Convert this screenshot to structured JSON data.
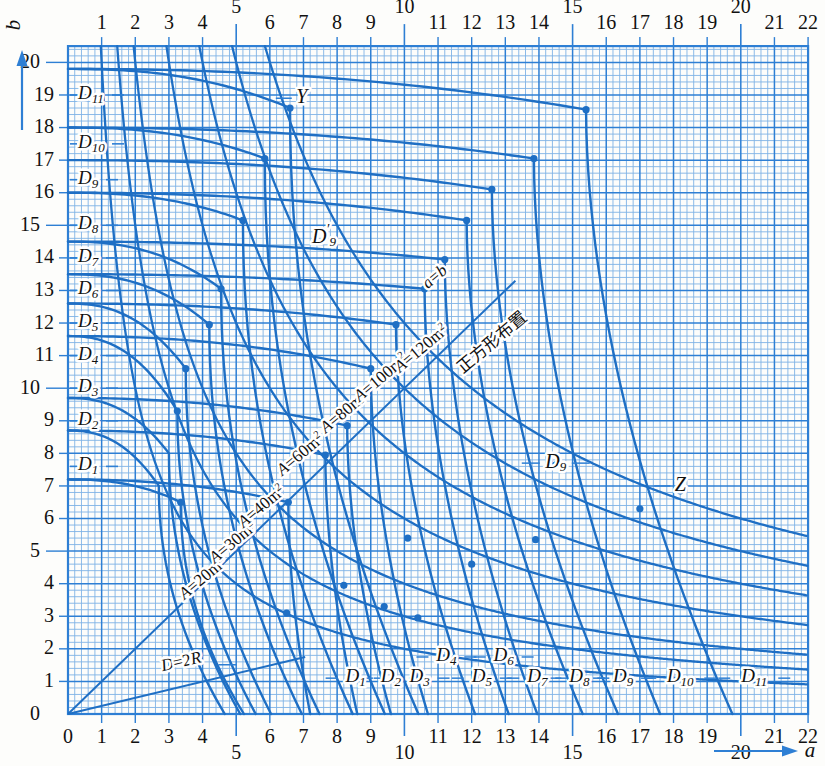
{
  "figure": {
    "axis_x_name": "a",
    "axis_y_name": "b",
    "note_cn": "正方形布置",
    "diag_ab": "a=b",
    "diag_d2r": "D=2R"
  },
  "chart_data": {
    "type": "line",
    "title": "",
    "xlabel": "a",
    "ylabel": "b",
    "xlim": [
      0,
      22
    ],
    "ylim": [
      0,
      20.5
    ],
    "grid": true,
    "minor_grid_step": 0.2,
    "major_grid_step": 1,
    "legend": "none",
    "xticks": [
      0,
      1,
      2,
      3,
      4,
      5,
      6,
      7,
      8,
      9,
      10,
      11,
      12,
      13,
      14,
      15,
      16,
      17,
      18,
      19,
      20,
      21,
      22
    ],
    "yticks": [
      0,
      1,
      2,
      3,
      4,
      5,
      6,
      7,
      8,
      9,
      10,
      11,
      12,
      13,
      14,
      15,
      16,
      17,
      18,
      19,
      20
    ],
    "xtick_labels_raised": [
      5,
      10,
      15,
      20
    ],
    "annotations": [
      {
        "text": "Y",
        "x": 6.95,
        "y": 18.9
      },
      {
        "text": "Z",
        "x": 18.2,
        "y": 7.0
      },
      {
        "text": "D′9",
        "x": 7.25,
        "y": 14.6
      },
      {
        "text": "D9",
        "x": 14.5,
        "y": 7.7
      },
      {
        "text": "正方形布置",
        "x": 12.6,
        "y": 11.4
      },
      {
        "text": "a=b",
        "x": 11.0,
        "y": 13.3
      },
      {
        "text": "D=2R",
        "x": 3.4,
        "y": 1.45
      }
    ],
    "area_curves": [
      {
        "name": "A=20m2",
        "label": "A=20m²",
        "A": 20,
        "label_x": 4.1,
        "label_y": 4.05
      },
      {
        "name": "A=30m2",
        "label": "A=30m²",
        "A": 30,
        "label_x": 5.0,
        "label_y": 5.15
      },
      {
        "name": "A=40m2",
        "label": "A=40m²",
        "A": 40,
        "label_x": 5.85,
        "label_y": 6.25
      },
      {
        "name": "A=60m2",
        "label": "A=60m²",
        "A": 60,
        "label_x": 7.0,
        "label_y": 7.85
      },
      {
        "name": "A=80m2",
        "label": "A=80m²",
        "A": 80,
        "label_x": 8.3,
        "label_y": 9.15
      },
      {
        "name": "A=100m2",
        "label": "A=100m²",
        "A": 100,
        "label_x": 9.4,
        "label_y": 10.2
      },
      {
        "name": "A=120m2",
        "label": "A=120m²",
        "A": 120,
        "label_x": 10.6,
        "label_y": 11.1
      }
    ],
    "d_curves": [
      {
        "name": "D1",
        "label": "D",
        "sub": "1",
        "left_b": 7.2,
        "left_label_y": 7.6,
        "top_label_x": 8.55,
        "knee_a": 6.55,
        "knee_b": 6.5,
        "end_a": 7.2,
        "end_b": 0.0
      },
      {
        "name": "D2",
        "label": "D",
        "sub": "2",
        "left_b": 8.7,
        "left_label_y": 9.0,
        "top_label_x": 9.6,
        "knee_a": 7.65,
        "knee_b": 7.95,
        "end_a": 8.6,
        "end_b": 0.0
      },
      {
        "name": "D3",
        "label": "D",
        "sub": "3",
        "left_b": 9.7,
        "left_label_y": 10.0,
        "top_label_x": 10.45,
        "knee_a": 8.3,
        "knee_b": 8.85,
        "end_a": 9.6,
        "end_b": 0.0
      },
      {
        "name": "D4",
        "label": "D",
        "sub": "4",
        "left_b": 11.6,
        "left_label_y": 11.0,
        "top_label_x": 11.25,
        "knee_a": 9.0,
        "knee_b": 10.6,
        "end_a": 10.7,
        "end_b": 0.0
      },
      {
        "name": "D5",
        "label": "D",
        "sub": "5",
        "left_b": 12.6,
        "left_label_y": 12.0,
        "top_label_x": 12.3,
        "knee_a": 9.75,
        "knee_b": 11.95,
        "end_a": 12.1,
        "end_b": 0.0
      },
      {
        "name": "D6",
        "label": "D",
        "sub": "6",
        "left_b": 13.5,
        "left_label_y": 13.0,
        "top_label_x": 12.95,
        "knee_a": 10.6,
        "knee_b": 13.05,
        "end_a": 13.1,
        "end_b": 0.0
      },
      {
        "name": "D7",
        "label": "D",
        "sub": "7",
        "left_b": 14.5,
        "left_label_y": 14.0,
        "top_label_x": 13.95,
        "knee_a": 11.2,
        "knee_b": 13.95,
        "end_a": 13.95,
        "end_b": 0.0
      },
      {
        "name": "D8",
        "label": "D",
        "sub": "8",
        "left_b": 16.0,
        "left_label_y": 15.0,
        "top_label_x": 15.2,
        "knee_a": 11.85,
        "knee_b": 15.15,
        "end_a": 15.3,
        "end_b": 0.0
      },
      {
        "name": "D9",
        "label": "D",
        "sub": "9",
        "left_b": 17.0,
        "left_label_y": 16.4,
        "top_label_x": 16.5,
        "knee_a": 12.6,
        "knee_b": 16.1,
        "end_a": 16.35,
        "end_b": 0.0
      },
      {
        "name": "D10",
        "label": "D",
        "sub": "10",
        "left_b": 18.0,
        "left_label_y": 17.5,
        "top_label_x": 18.2,
        "knee_a": 13.85,
        "knee_b": 17.05,
        "end_a": 17.6,
        "end_b": 0.0
      },
      {
        "name": "D11",
        "label": "D",
        "sub": "11",
        "left_b": 19.8,
        "left_label_y": 19.0,
        "top_label_x": 20.4,
        "knee_a": 15.4,
        "knee_b": 18.55,
        "end_a": 19.75,
        "end_b": 0.0
      }
    ],
    "upper_d_curves": [
      {
        "name": "D11-upper",
        "start_b": 19.8,
        "knee_a": 6.6,
        "knee_b": 18.6
      },
      {
        "name": "D10-upper",
        "start_b": 18.0,
        "knee_a": 5.85,
        "knee_b": 17.05
      },
      {
        "name": "D9-upper",
        "start_b": 16.0,
        "knee_a": 5.2,
        "knee_b": 15.15
      },
      {
        "name": "D8-upper",
        "start_b": 14.5,
        "knee_a": 4.55,
        "knee_b": 13.05
      },
      {
        "name": "D7-upper",
        "start_b": 13.5,
        "knee_a": 4.2,
        "knee_b": 11.95
      },
      {
        "name": "D6-upper",
        "start_b": 12.6,
        "knee_a": 3.5,
        "knee_b": 10.6
      },
      {
        "name": "D5-upper",
        "start_b": 11.6,
        "knee_a": 3.25,
        "knee_b": 9.3
      },
      {
        "name": "D4-upper",
        "start_b": 9.7,
        "knee_a": 3.0,
        "knee_b": 8.0
      },
      {
        "name": "D3-upper",
        "start_b": 8.7,
        "knee_a": 2.7,
        "knee_b": 7.0
      },
      {
        "name": "D2-upper",
        "start_b": 7.2,
        "knee_a": 3.35,
        "knee_b": 6.5
      }
    ],
    "markers": [
      {
        "a": 6.6,
        "b": 18.6
      },
      {
        "a": 5.85,
        "b": 17.05
      },
      {
        "a": 5.2,
        "b": 15.15
      },
      {
        "a": 4.55,
        "b": 13.05
      },
      {
        "a": 4.2,
        "b": 11.95
      },
      {
        "a": 3.5,
        "b": 10.6
      },
      {
        "a": 3.25,
        "b": 9.3
      },
      {
        "a": 3.35,
        "b": 6.5
      },
      {
        "a": 6.55,
        "b": 6.5
      },
      {
        "a": 7.65,
        "b": 7.95
      },
      {
        "a": 8.3,
        "b": 8.85
      },
      {
        "a": 9.0,
        "b": 10.6
      },
      {
        "a": 9.75,
        "b": 11.95
      },
      {
        "a": 10.6,
        "b": 13.05
      },
      {
        "a": 11.2,
        "b": 13.95
      },
      {
        "a": 11.85,
        "b": 15.15
      },
      {
        "a": 12.6,
        "b": 16.1
      },
      {
        "a": 13.85,
        "b": 17.05
      },
      {
        "a": 15.4,
        "b": 18.55
      },
      {
        "a": 6.5,
        "b": 3.1
      },
      {
        "a": 8.2,
        "b": 3.95
      },
      {
        "a": 9.4,
        "b": 3.3
      },
      {
        "a": 10.4,
        "b": 2.95
      },
      {
        "a": 10.1,
        "b": 5.4
      },
      {
        "a": 12.0,
        "b": 4.6
      },
      {
        "a": 13.9,
        "b": 5.35
      },
      {
        "a": 14.5,
        "b": 7.65
      },
      {
        "a": 17.0,
        "b": 6.3
      },
      {
        "a": 18.2,
        "b": 6.85
      },
      {
        "a": 4.5,
        "b": 4.55
      }
    ],
    "diagonals": [
      {
        "name": "a=b",
        "from": [
          0,
          0
        ],
        "to": [
          13.3,
          13.3
        ]
      },
      {
        "name": "D=2R",
        "from": [
          0,
          0
        ],
        "to": [
          7.05,
          1.75
        ]
      }
    ]
  },
  "colors": {
    "curve": "#1f6fc4",
    "grid_minor": "#7fb2e5",
    "grid_major": "#2e7fd4",
    "text": "#111111"
  }
}
